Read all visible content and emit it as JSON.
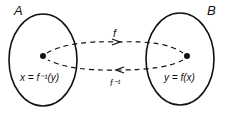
{
  "diagram": {
    "set_a": {
      "label": "A",
      "element_label": "x = f⁻¹(y)"
    },
    "set_b": {
      "label": "B",
      "element_label": "y = f(x)"
    },
    "forward_arrow": {
      "label": "f"
    },
    "inverse_arrow": {
      "label": "f⁻¹"
    },
    "colors": {
      "stroke": "#111111",
      "background": "#ffffff"
    }
  }
}
